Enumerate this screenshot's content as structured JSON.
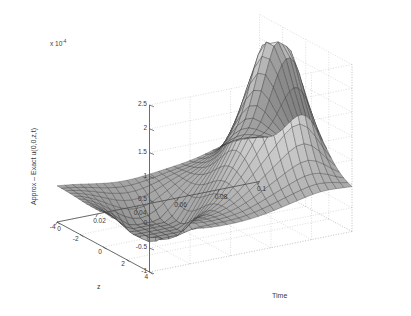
{
  "figure": {
    "background": "#ffffff",
    "axis_color": "#4a4a4a",
    "grid_color": "#b9b9b9",
    "text_color": "#3a3a3a"
  },
  "labels": {
    "exponent_prefix": "x 10",
    "exponent_power": "-4",
    "zaxis_value_label": "Approx – Exact u(0,0,z,t)",
    "time_axis_name": "Time",
    "z_axis_name": "z"
  },
  "chart_data": {
    "type": "surface",
    "title": "",
    "xlabel": "Time",
    "ylabel": "z",
    "zlabel": "Approx – Exact u(0,0,z,t)",
    "z_scale_exponent": -4,
    "z_scale_text": "x 10^-4",
    "xlim": [
      0,
      0.1
    ],
    "ylim": [
      -4,
      4
    ],
    "zlim": [
      -1,
      2.5
    ],
    "grid": true,
    "legend": null,
    "colormap": "gray",
    "shading": "faceted-gray",
    "x_ticks": [
      0,
      0.02,
      0.04,
      0.06,
      0.08,
      0.1
    ],
    "x_tick_labels": [
      "0",
      "0.02",
      "0.04",
      "0.06",
      "0.08",
      "0.1"
    ],
    "y_ticks": [
      4,
      2,
      0,
      -2,
      -4
    ],
    "y_tick_labels": [
      "4",
      "2",
      "0",
      "-2",
      "-4"
    ],
    "z_ticks": [
      2.5,
      2,
      1.5,
      1,
      0.5,
      0,
      -0.5,
      -1
    ],
    "z_tick_labels": [
      "2.5",
      "2",
      "1.5",
      "1",
      "0.5",
      "0",
      "-0.5",
      "-1"
    ],
    "view": {
      "azimuth": -37.5,
      "elevation": 30
    },
    "peak": {
      "x": 0.085,
      "y": 0.0,
      "z": 2.5
    },
    "trough": {
      "x": 0.03,
      "y": -1.0,
      "z": -1.0
    },
    "nx": 26,
    "ny": 22
  }
}
